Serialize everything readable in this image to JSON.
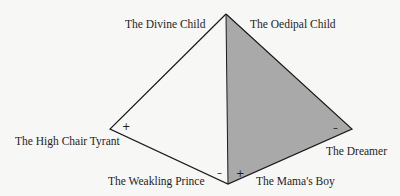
{
  "diagram": {
    "type": "pyramid-faces",
    "colors": {
      "background": "#f7f7f5",
      "shaded_face": "#a9a9a9",
      "line": "#1a1a1a"
    },
    "vertices": {
      "apex": [
        226,
        14
      ],
      "left": [
        110,
        129
      ],
      "bottom": [
        228,
        184
      ],
      "right": [
        352,
        129
      ]
    },
    "labels": {
      "divine_child": "The Divine Child",
      "oedipal_child": "The Oedipal Child",
      "high_chair_tyrant": "The High Chair Tyrant",
      "weakling_prince": "The Weakling Prince",
      "mamas_boy": "The Mama's Boy",
      "dreamer": "The Dreamer"
    },
    "signs": {
      "high_chair_tyrant": "+",
      "weakling_prince": "–",
      "mamas_boy": "+",
      "dreamer": "–"
    }
  }
}
